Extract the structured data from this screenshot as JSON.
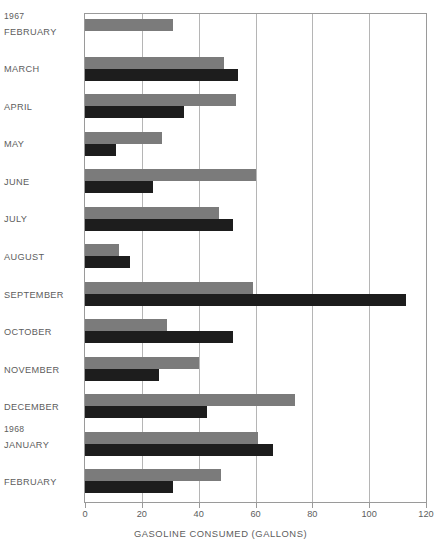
{
  "chart_data": {
    "type": "bar",
    "orientation": "horizontal",
    "title": "",
    "xlabel": "GASOLINE CONSUMED (GALLONS)",
    "ylabel": "",
    "xlim": [
      0,
      120
    ],
    "xticks": [
      0,
      20,
      40,
      60,
      80,
      100,
      120
    ],
    "xtick_labels": [
      "0",
      "20",
      "40",
      "60",
      "80",
      "100",
      "120"
    ],
    "grid": true,
    "grid_axis": "x",
    "legend": "none",
    "categories": [
      "FEBRUARY",
      "MARCH",
      "APRIL",
      "MAY",
      "JUNE",
      "JULY",
      "AUGUST",
      "SEPTEMBER",
      "OCTOBER",
      "NOVEMBER",
      "DECEMBER",
      "JANUARY",
      "FEBRUARY"
    ],
    "year_annotations": [
      {
        "label": "1967",
        "before_category_index": 0
      },
      {
        "label": "1968",
        "before_category_index": 11
      }
    ],
    "series": [
      {
        "name": "series-a",
        "color": "#7b7b7b",
        "values": [
          31,
          49,
          53,
          27,
          60,
          47,
          12,
          59,
          29,
          40,
          74,
          61,
          48
        ]
      },
      {
        "name": "series-b",
        "color": "#1d1d1d",
        "values": [
          0,
          54,
          35,
          11,
          24,
          52,
          16,
          113,
          52,
          26,
          43,
          66,
          31
        ]
      }
    ]
  },
  "colors": {
    "series_a": "#7b7b7b",
    "series_b": "#1d1d1d",
    "grid": "#b5b5b5",
    "frame": "#9a9a9a",
    "text": "#5d5d5d",
    "background": "#ffffff"
  }
}
